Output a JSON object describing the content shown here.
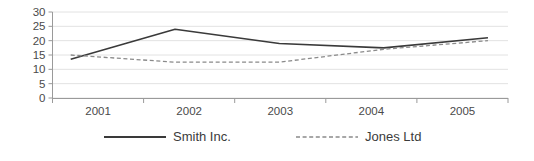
{
  "chart_data": {
    "type": "line",
    "title": "",
    "xlabel": "",
    "ylabel": "",
    "categories": [
      "2001",
      "2002",
      "2003",
      "2004",
      "2005"
    ],
    "yticks": [
      "0",
      "5",
      "10",
      "15",
      "20",
      "25",
      "30"
    ],
    "ylim": [
      0,
      30
    ],
    "grid": true,
    "legend_position": "bottom",
    "series": [
      {
        "name": "Smith Inc.",
        "style": "solid",
        "color": "#3a3a3a",
        "values": [
          13.5,
          24,
          19,
          17.5,
          21
        ]
      },
      {
        "name": "Jones Ltd",
        "style": "dashed",
        "color": "#8a8a8a",
        "values": [
          15,
          12.5,
          12.5,
          17,
          20
        ]
      }
    ]
  },
  "axis": {
    "y_labels": [
      "30",
      "25",
      "20",
      "15",
      "10",
      "5",
      "0"
    ],
    "x_labels": [
      "2001",
      "2002",
      "2003",
      "2004",
      "2005"
    ]
  },
  "legend": {
    "items": [
      {
        "label": "Smith Inc.",
        "style": "solid"
      },
      {
        "label": "Jones Ltd",
        "style": "dashed"
      }
    ]
  },
  "colors": {
    "series_solid": "#3a3a3a",
    "series_dashed": "#8a8a8a",
    "gridline": "#e2e2e2",
    "axis": "#9a9a9a",
    "text": "#3b3b3b"
  }
}
